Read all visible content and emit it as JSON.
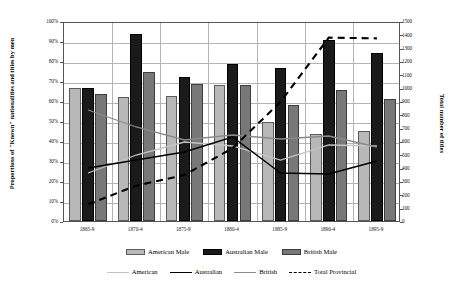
{
  "chart_data": {
    "type": "bar",
    "title": "",
    "subtitle": "",
    "xlabel": "",
    "ylabel": "Proportions of \"Known\" nationalities and titles by men",
    "y2label": "Total number of titles",
    "grid": true,
    "legend_position": "bottom",
    "categories": [
      "1865-9",
      "1870-4",
      "1875-9",
      "1880-4",
      "1885-9",
      "1890-4",
      "1895-9"
    ],
    "ylim": [
      0,
      100
    ],
    "y2lim": [
      0,
      1500
    ],
    "yticks": [
      "0%",
      "10%",
      "20%",
      "30%",
      "40%",
      "50%",
      "60%",
      "70%",
      "80%",
      "90%",
      "100%"
    ],
    "y2ticks": [
      "0",
      "100",
      "200",
      "300",
      "400",
      "500",
      "600",
      "700",
      "800",
      "900",
      "1000",
      "1100",
      "1200",
      "1300",
      "1400",
      "1500"
    ],
    "bar_series": [
      {
        "name": "American Male",
        "color": "#b8b8b8",
        "axis": "left",
        "values": [
          66.5,
          62.0,
          62.5,
          68.0,
          49.5,
          43.5,
          45.0
        ]
      },
      {
        "name": "Australian Male",
        "color": "#1a1a1a",
        "axis": "left",
        "values": [
          66.5,
          93.5,
          72.0,
          78.5,
          76.5,
          90.5,
          84.0
        ]
      },
      {
        "name": "British Male",
        "color": "#787878",
        "axis": "left",
        "values": [
          63.5,
          74.5,
          68.5,
          68.0,
          58.0,
          65.5,
          61.0
        ]
      }
    ],
    "line_series": [
      {
        "name": "American",
        "color": "#c4c4c4",
        "style": "solid",
        "axis": "left",
        "values": [
          25.0,
          34.0,
          40.5,
          38.5,
          31.5,
          39.0,
          38.5
        ]
      },
      {
        "name": "Australian",
        "color": "#000000",
        "style": "solid",
        "axis": "left",
        "values": [
          27.5,
          31.5,
          35.5,
          43.0,
          25.0,
          24.5,
          31.0
        ]
      },
      {
        "name": "British",
        "color": "#8a8a8a",
        "style": "solid",
        "axis": "left",
        "values": [
          56.5,
          48.0,
          41.5,
          44.0,
          42.0,
          43.5,
          38.0
        ]
      },
      {
        "name": "Total Provincial",
        "color": "#000000",
        "style": "dashed",
        "axis": "right",
        "values": [
          140,
          280,
          360,
          560,
          910,
          1390,
          1385
        ]
      }
    ]
  },
  "legend": {
    "bars": [
      {
        "label": "American Male",
        "swatch": "american"
      },
      {
        "label": "Australian Male",
        "swatch": "australian"
      },
      {
        "label": "British Male",
        "swatch": "british"
      }
    ],
    "lines": [
      {
        "label": "American",
        "swatch": "american"
      },
      {
        "label": "Australian",
        "swatch": "australian"
      },
      {
        "label": "British",
        "swatch": "british"
      },
      {
        "label": "Total Provincial",
        "swatch": "total"
      }
    ]
  }
}
